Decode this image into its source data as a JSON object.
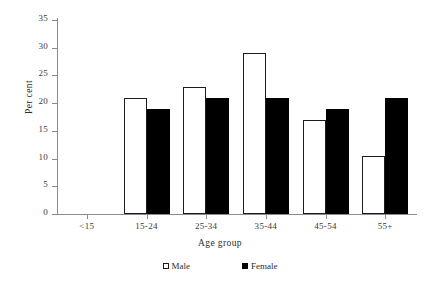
{
  "chart_data": {
    "type": "bar",
    "title": "",
    "subtitle": "",
    "xlabel": "Age group",
    "ylabel": "Per cent",
    "categories": [
      "<15",
      "15-24",
      "25-34",
      "35-44",
      "45-54",
      "55+"
    ],
    "series": [
      {
        "name": "Male",
        "values": [
          0,
          21,
          23,
          29,
          17,
          10.5
        ],
        "color": "#ffffff",
        "edge_color": "#1c1c1c"
      },
      {
        "name": "Female",
        "values": [
          0,
          19,
          21,
          21,
          19,
          21
        ],
        "color": "#000000",
        "edge_color": "#000000"
      }
    ],
    "ylim": [
      0,
      35
    ],
    "yticks": [
      0,
      5,
      10,
      15,
      20,
      25,
      30,
      35
    ],
    "ytick_labels": [
      "0",
      "5",
      "10",
      "15",
      "20",
      "25",
      "30",
      "35"
    ],
    "grid": false,
    "legend_position": "bottom"
  },
  "legend": {
    "items": [
      {
        "label": "Male",
        "swatch": "open-square"
      },
      {
        "label": "Female",
        "swatch": "filled-square"
      }
    ]
  },
  "axes": {
    "y_title": "Per cent",
    "x_title": "Age group"
  }
}
